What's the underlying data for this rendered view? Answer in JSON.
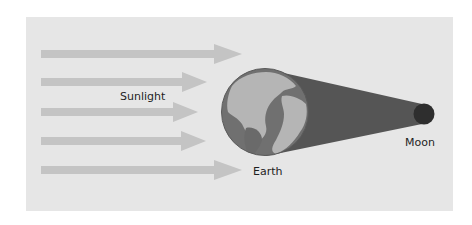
{
  "diagram": {
    "type": "lunar-eclipse",
    "labels": {
      "sunlight": "Sunlight",
      "earth": "Earth",
      "moon": "Moon"
    },
    "sunlight_arrows": [
      {
        "y": 54,
        "tip_x": 242
      },
      {
        "y": 82,
        "tip_x": 207
      },
      {
        "y": 112,
        "tip_x": 198
      },
      {
        "y": 141,
        "tip_x": 206
      },
      {
        "y": 170,
        "tip_x": 242
      }
    ],
    "colors": {
      "background_panel": "#e6e6e6",
      "arrow": "#c4c4c4",
      "earth_ocean": "#6e6e6e",
      "earth_land": "#b3b3b3",
      "shadow_cone": "#555555",
      "moon": "#2e2e2e",
      "text": "#1e1e1e"
    }
  }
}
